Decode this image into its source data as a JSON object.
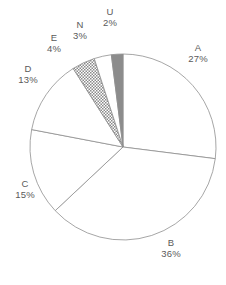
{
  "chart_data": {
    "type": "pie",
    "title": "",
    "subtitle": "",
    "xlabel": "",
    "ylabel": "",
    "legend_position": "outside-labels",
    "grid": false,
    "start_angle_deg": 0,
    "direction": "clockwise",
    "categories": [
      "A",
      "B",
      "C",
      "D",
      "E",
      "N",
      "U"
    ],
    "values": [
      27,
      36,
      15,
      13,
      4,
      3,
      2
    ],
    "value_unit": "%",
    "slices": [
      {
        "name": "A",
        "value": 27,
        "label": "A",
        "pct_label": "27%",
        "fill": "#ffffff",
        "pattern": "none"
      },
      {
        "name": "B",
        "value": 36,
        "label": "B",
        "pct_label": "36%",
        "fill": "#ffffff",
        "pattern": "none"
      },
      {
        "name": "C",
        "value": 15,
        "label": "C",
        "pct_label": "15%",
        "fill": "#ffffff",
        "pattern": "none"
      },
      {
        "name": "D",
        "value": 13,
        "label": "D",
        "pct_label": "13%",
        "fill": "#ffffff",
        "pattern": "none"
      },
      {
        "name": "E",
        "value": 4,
        "label": "E",
        "pct_label": "4%",
        "fill": "#9a9a9a",
        "pattern": "checker"
      },
      {
        "name": "N",
        "value": 3,
        "label": "N",
        "pct_label": "3%",
        "fill": "#ffffff",
        "pattern": "none"
      },
      {
        "name": "U",
        "value": 2,
        "label": "U",
        "pct_label": "2%",
        "fill": "#8c8c8c",
        "pattern": "solid-gray"
      }
    ]
  },
  "style": {
    "background": "#ffffff",
    "outline_color": "#8f8f8f",
    "text_color": "#5a5a5a",
    "hatch_color": "#9a9a9a",
    "solid_gray": "#8c8c8c"
  }
}
